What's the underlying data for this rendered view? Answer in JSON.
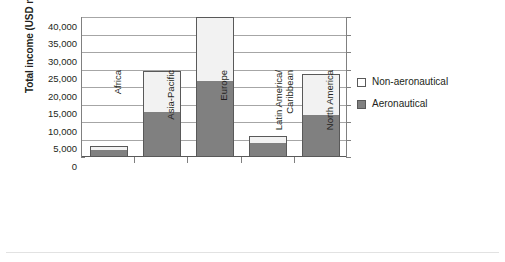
{
  "chart_data": {
    "type": "bar",
    "subtype": "stacked-vertical",
    "title": "",
    "xlabel": "",
    "ylabel": "Total income (USD million)",
    "categories": [
      "Africa",
      "Asia-Pacific",
      "Europe",
      "Latin America/\nCaribbean",
      "North America"
    ],
    "series": [
      {
        "name": "Aeronautical",
        "values": [
          2100,
          12800,
          21800,
          4000,
          12100
        ],
        "color": "#808080"
      },
      {
        "name": "Non-aeronautical",
        "values": [
          1100,
          11900,
          18200,
          1900,
          11600
        ],
        "color": "#f2f2f2"
      }
    ],
    "stack_totals": [
      3200,
      24700,
      40000,
      5900,
      23700
    ],
    "ylim": [
      0,
      40000
    ],
    "ytick_values": [
      0,
      5000,
      10000,
      15000,
      20000,
      25000,
      30000,
      35000,
      40000
    ],
    "ytick_labels": [
      "0",
      "5,000",
      "10,000",
      "15,000",
      "20,000",
      "25,000",
      "30,000",
      "35,000",
      "40,000"
    ],
    "grid": "horizontal",
    "legend_position": "right",
    "legend_order": [
      "Non-aeronautical",
      "Aeronautical"
    ]
  },
  "legend": {
    "items": [
      {
        "label": "Non-aeronautical",
        "swatch": "legend-swatch-non-aeronautical"
      },
      {
        "label": "Aeronautical",
        "swatch": "legend-swatch-aeronautical"
      }
    ]
  }
}
